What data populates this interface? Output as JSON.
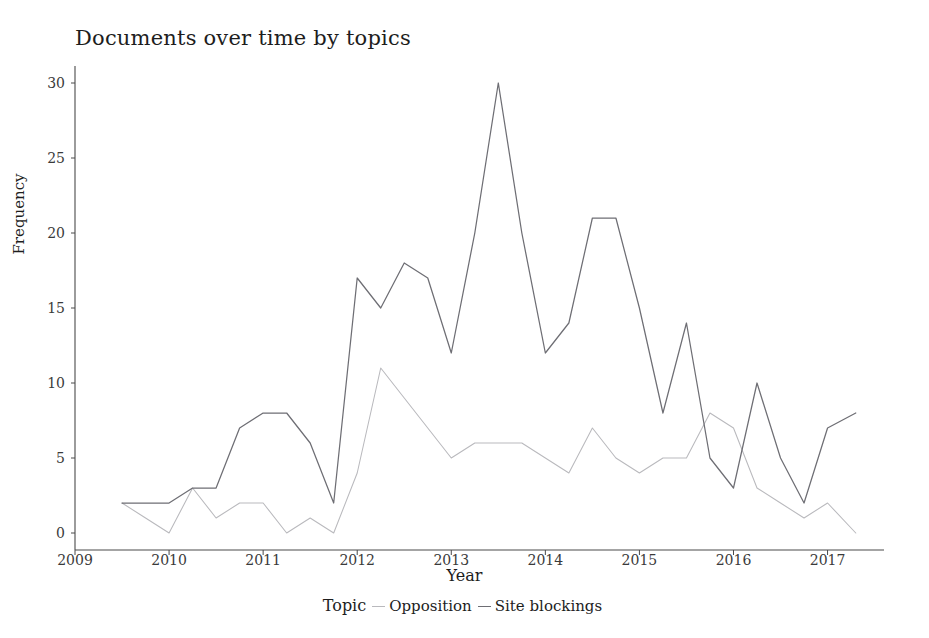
{
  "chart_data": {
    "type": "line",
    "title": "Documents over time by topics",
    "xlabel": "Year",
    "ylabel": "Frequency",
    "legend_title": "Topic",
    "legend_position": "bottom",
    "grid": false,
    "xlim": [
      2009.0,
      2017.6
    ],
    "ylim": [
      0,
      31
    ],
    "xticks": [
      2009,
      2010,
      2011,
      2012,
      2013,
      2014,
      2015,
      2016,
      2017
    ],
    "xtick_labels": [
      "2009",
      "2010",
      "2011",
      "2012",
      "2013",
      "2014",
      "2015",
      "2016",
      "2017"
    ],
    "yticks": [
      0,
      5,
      10,
      15,
      20,
      25,
      30
    ],
    "ytick_labels": [
      "0",
      "5",
      "10",
      "15",
      "20",
      "25",
      "30"
    ],
    "x": [
      2009.5,
      2009.75,
      2010.0,
      2010.25,
      2010.5,
      2010.75,
      2011.0,
      2011.25,
      2011.5,
      2011.75,
      2012.0,
      2012.25,
      2012.5,
      2012.75,
      2013.0,
      2013.25,
      2013.5,
      2013.75,
      2014.0,
      2014.25,
      2014.5,
      2014.75,
      2015.0,
      2015.25,
      2015.5,
      2015.75,
      2016.0,
      2016.25,
      2016.5,
      2016.75,
      2017.0,
      2017.3
    ],
    "series": [
      {
        "name": "Opposition",
        "color": "#b9b9bd",
        "values": [
          2,
          1,
          0,
          3,
          1,
          2,
          2,
          0,
          1,
          0,
          4,
          11,
          9,
          7,
          5,
          6,
          6,
          6,
          5,
          4,
          7,
          5,
          4,
          5,
          5,
          8,
          7,
          3,
          2,
          1,
          2,
          0
        ]
      },
      {
        "name": "Site blockings",
        "color": "#6e6e74",
        "values": [
          2,
          2,
          2,
          3,
          3,
          7,
          8,
          8,
          6,
          2,
          17,
          15,
          18,
          17,
          12,
          20,
          30,
          20,
          12,
          14,
          21,
          21,
          15,
          8,
          14,
          5,
          3,
          10,
          5,
          2,
          7,
          8
        ]
      }
    ]
  },
  "axes": {
    "axis_color": "#4a4a4a"
  }
}
